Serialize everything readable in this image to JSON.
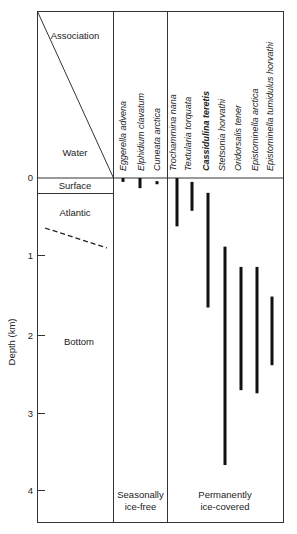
{
  "diagram": {
    "header_labels": {
      "association": "Association",
      "water": "Water"
    },
    "water_masses": [
      {
        "label": "Surface",
        "top_km": 0,
        "bottom_km": 0.2
      },
      {
        "label": "Atlantic",
        "top_km": 0.2,
        "bottom_km": 0.85
      },
      {
        "label": "Bottom",
        "top_km": 0.85,
        "bottom_km": 4.4
      }
    ],
    "y_axis": {
      "label": "Depth (km)",
      "ticks": [
        0,
        1,
        2,
        3,
        4
      ],
      "range_km": [
        0,
        4.4
      ]
    },
    "groups": [
      {
        "label_line1": "Seasonally",
        "label_line2": "ice-free",
        "species": [
          {
            "name": "Eggerella advena",
            "bold": false,
            "top_km": 0.0,
            "bottom_km": 0.05
          },
          {
            "name": "Elphidium clavatum",
            "bold": false,
            "top_km": 0.0,
            "bottom_km": 0.13
          },
          {
            "name": "Cuneata arctica",
            "bold": false,
            "top_km": 0.04,
            "bottom_km": 0.08
          }
        ]
      },
      {
        "label_line1": "Permanently",
        "label_line2": "ice-covered",
        "species": [
          {
            "name": "Trochammina nana",
            "bold": false,
            "top_km": 0.0,
            "bottom_km": 0.62
          },
          {
            "name": "Textularia torquata",
            "bold": false,
            "top_km": 0.05,
            "bottom_km": 0.42
          },
          {
            "name": "Cassidulina teretis",
            "bold": true,
            "top_km": 0.19,
            "bottom_km": 1.66
          },
          {
            "name": "Stetsonia horvathi",
            "bold": false,
            "top_km": 0.88,
            "bottom_km": 3.68
          },
          {
            "name": "Oridorsalis tener",
            "bold": false,
            "top_km": 1.14,
            "bottom_km": 2.72
          },
          {
            "name": "Epistominella arctica",
            "bold": false,
            "top_km": 1.14,
            "bottom_km": 2.76
          },
          {
            "name": "Epistominella tumidulus horvathi",
            "bold": false,
            "top_km": 1.52,
            "bottom_km": 2.4
          }
        ]
      }
    ],
    "colors": {
      "line": "#333333",
      "bar": "#111111",
      "text": "#222222"
    }
  }
}
